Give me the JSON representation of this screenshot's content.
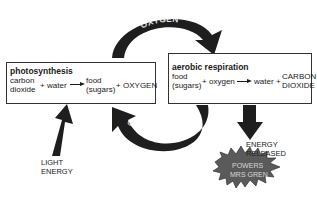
{
  "diagram": {
    "photosynthesis": {
      "title": "photosynthesis",
      "reactant1_line1": "carbon",
      "reactant1_line2": "dioxide",
      "plus1": "+",
      "reactant2": "water",
      "product1_line1": "food",
      "product1_line2": "(sugars)",
      "plus2": "+",
      "product2": "OXYGEN"
    },
    "respiration": {
      "title": "aerobic respiration",
      "reactant1_line1": "food",
      "reactant1_line2": "(sugars)",
      "plus1": "+",
      "reactant2": "oxygen",
      "product1": "water",
      "plus2": "+",
      "product2_line1": "CARBON",
      "product2_line2": "DIOXIDE"
    },
    "oxygen_arrow_label": "OXYGEN",
    "carbon_dioxide_arrow_label": "CARBON DIOXIDE",
    "light_energy_line1": "LIGHT",
    "light_energy_line2": "ENERGY",
    "energy_released_line1": "ENERGY",
    "energy_released_line2": "RELEASED",
    "starburst_line1": "POWERS",
    "starburst_line2": "MRS GREN",
    "colors": {
      "arrow": "#1e1e1e",
      "starburst": "#5a5a5a",
      "box_border": "#333333"
    }
  }
}
